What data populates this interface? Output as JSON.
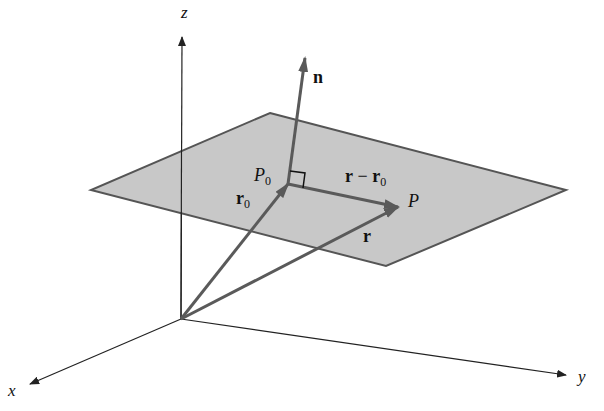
{
  "diagram": {
    "colors": {
      "background": "#ffffff",
      "plane_fill": "#c8c8c8",
      "plane_edge": "#555555",
      "vector": "#5a5a5a",
      "axis": "#222222"
    },
    "axes": {
      "origin": [
        181,
        319
      ],
      "x": {
        "label": "x",
        "tip": [
          29,
          384
        ]
      },
      "y": {
        "label": "y",
        "tip": [
          567,
          375
        ]
      },
      "z": {
        "label": "z",
        "tip": [
          182,
          35
        ]
      }
    },
    "plane": {
      "vertices": [
        [
          270,
          113
        ],
        [
          566,
          190
        ],
        [
          386,
          266
        ],
        [
          91,
          190
        ]
      ]
    },
    "points": {
      "P0": {
        "label": "P",
        "subscript": "0",
        "position": [
          288,
          184
        ]
      },
      "P": {
        "label": "P",
        "subscript": "",
        "position": [
          398,
          207
        ]
      }
    },
    "vectors": {
      "n": {
        "label": "n",
        "from": [
          288,
          184
        ],
        "to": [
          305,
          58
        ]
      },
      "r0": {
        "label": "r",
        "subscript": "0",
        "from": [
          181,
          319
        ],
        "to": [
          288,
          184
        ]
      },
      "r": {
        "label": "r",
        "from": [
          181,
          319
        ],
        "to": [
          398,
          207
        ]
      },
      "r_minus_r0": {
        "label_a": "r",
        "operator": "−",
        "label_b": "r",
        "subscript": "0",
        "from": [
          288,
          184
        ],
        "to": [
          398,
          207
        ]
      }
    },
    "right_angle_marker": true
  }
}
